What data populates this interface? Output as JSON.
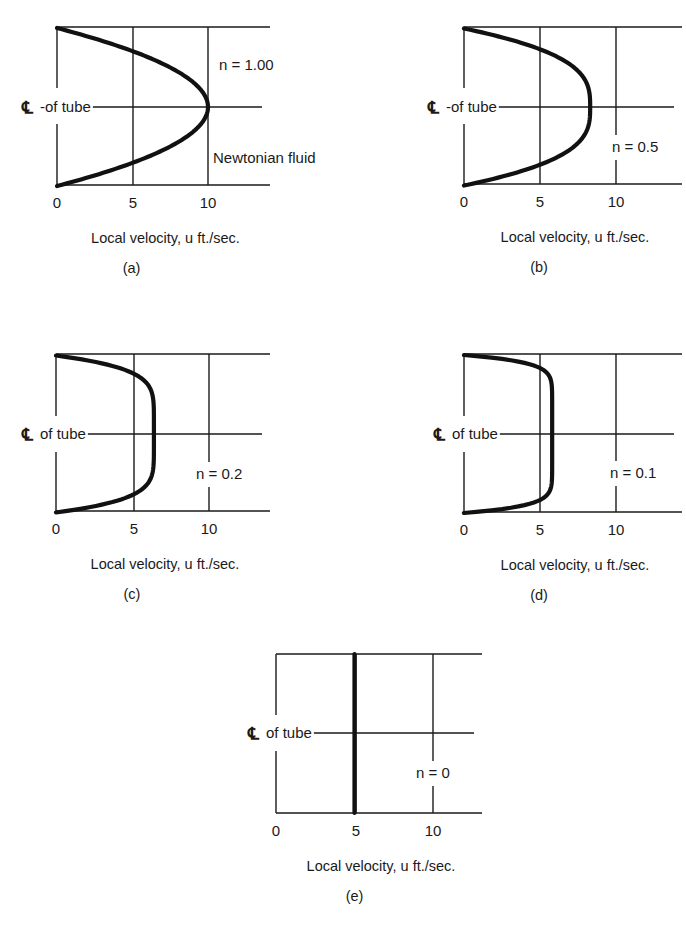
{
  "figure": {
    "centerline_symbol": "℄",
    "xlabel": "Local velocity, u ft./sec.",
    "xticks": [
      "0",
      "5",
      "10"
    ]
  },
  "chart_data": [
    {
      "type": "line",
      "id": "a",
      "caption": "(a)",
      "title": "",
      "annotation": "n = 1.00",
      "annotation2": "Newtonian fluid",
      "centerline_label": "-of tube",
      "xlabel": "Local velocity, u ft./sec.",
      "ylabel": "℄ of tube",
      "xticks": [
        0,
        5,
        10
      ],
      "xlim": [
        0,
        14
      ],
      "grid": true,
      "n": 1.0,
      "max_velocity": 10.0,
      "series": [
        {
          "name": "velocity profile n=1.00",
          "r_over_R": [
            -1,
            -0.75,
            -0.5,
            -0.25,
            0,
            0.25,
            0.5,
            0.75,
            1
          ],
          "u": [
            0,
            4.4,
            7.5,
            9.4,
            10.0,
            9.4,
            7.5,
            4.4,
            0
          ]
        }
      ],
      "layout": {
        "x0": 57,
        "x5": 133,
        "x10": 208,
        "xend": 270,
        "ytop": 27,
        "ymid": 107,
        "ybot": 185,
        "label_gap": [
          88,
          124
        ],
        "annot_x": 219,
        "annot_y": 70,
        "annot2_x": 213,
        "annot2_y": 163,
        "cl_x": 22
      }
    },
    {
      "type": "line",
      "id": "b",
      "caption": "(b)",
      "title": "",
      "annotation": "n = 0.5",
      "centerline_label": "-of tube",
      "xlabel": "Local velocity, u ft./sec.",
      "ylabel": "℄ of tube",
      "xticks": [
        0,
        5,
        10
      ],
      "xlim": [
        0,
        14
      ],
      "grid": true,
      "n": 0.5,
      "max_velocity": 8.3,
      "series": [
        {
          "name": "velocity profile n=0.5",
          "r_over_R": [
            -1,
            -0.75,
            -0.5,
            -0.25,
            0,
            0.25,
            0.5,
            0.75,
            1
          ],
          "u": [
            0,
            4.9,
            7.0,
            8.0,
            8.3,
            8.0,
            7.0,
            4.9,
            0
          ]
        }
      ],
      "layout": {
        "x0": 464,
        "x5": 540,
        "x10": 616,
        "xend": 682,
        "ytop": 27,
        "ymid": 107,
        "ybot": 184,
        "label_gap": [
          88,
          124
        ],
        "annot_x": 612,
        "annot_y": 152,
        "cl_x": 428
      }
    },
    {
      "type": "line",
      "id": "c",
      "caption": "(c)",
      "title": "",
      "annotation": "n = 0.2",
      "centerline_label": "of tube",
      "xlabel": "Local velocity, u ft./sec.",
      "ylabel": "℄ of tube",
      "xticks": [
        0,
        5,
        10
      ],
      "xlim": [
        0,
        14
      ],
      "grid": true,
      "n": 0.2,
      "max_velocity": 6.4,
      "series": [
        {
          "name": "velocity profile n=0.2",
          "r_over_R": [
            -1,
            -0.75,
            -0.5,
            -0.25,
            0,
            0.25,
            0.5,
            0.75,
            1
          ],
          "u": [
            0,
            5.2,
            6.1,
            6.4,
            6.4,
            6.4,
            6.1,
            5.2,
            0
          ]
        }
      ],
      "layout": {
        "x0": 56,
        "x5": 134,
        "x10": 209,
        "xend": 270,
        "ytop": 354,
        "ymid": 434,
        "ybot": 511,
        "label_gap": [
          416,
          452
        ],
        "annot_x": 196,
        "annot_y": 479,
        "cl_x": 22
      }
    },
    {
      "type": "line",
      "id": "d",
      "caption": "(d)",
      "title": "",
      "annotation": "n = 0.1",
      "centerline_label": "of tube",
      "xlabel": "Local velocity, u ft./sec.",
      "ylabel": "℄ of tube",
      "xticks": [
        0,
        5,
        10
      ],
      "xlim": [
        0,
        14
      ],
      "grid": true,
      "n": 0.1,
      "max_velocity": 5.8,
      "series": [
        {
          "name": "velocity profile n=0.1",
          "r_over_R": [
            -1,
            -0.75,
            -0.5,
            -0.25,
            0,
            0.25,
            0.5,
            0.75,
            1
          ],
          "u": [
            0,
            5.5,
            5.8,
            5.8,
            5.8,
            5.8,
            5.8,
            5.5,
            0
          ]
        }
      ],
      "layout": {
        "x0": 464,
        "x5": 540,
        "x10": 616,
        "xend": 682,
        "ytop": 354,
        "ymid": 434,
        "ybot": 512,
        "label_gap": [
          416,
          452
        ],
        "annot_x": 610,
        "annot_y": 478,
        "cl_x": 434
      }
    },
    {
      "type": "line",
      "id": "e",
      "caption": "(e)",
      "title": "",
      "annotation": "n = 0",
      "centerline_label": "of tube",
      "xlabel": "Local velocity, u ft./sec.",
      "ylabel": "℄ of tube",
      "xticks": [
        0,
        5,
        10
      ],
      "xlim": [
        0,
        14
      ],
      "grid": true,
      "n": 0,
      "max_velocity": 5.0,
      "series": [
        {
          "name": "velocity profile n=0 (plug flow)",
          "r_over_R": [
            -1,
            -0.5,
            0,
            0.5,
            1
          ],
          "u": [
            5,
            5,
            5,
            5,
            5
          ]
        }
      ],
      "layout": {
        "x0": 276,
        "x5": 356,
        "x10": 433,
        "xend": 482,
        "ytop": 654,
        "ymid": 733,
        "ybot": 813,
        "label_gap": [
          715,
          751
        ],
        "annot_x": 416,
        "annot_y": 778,
        "cl_x": 248
      }
    }
  ]
}
